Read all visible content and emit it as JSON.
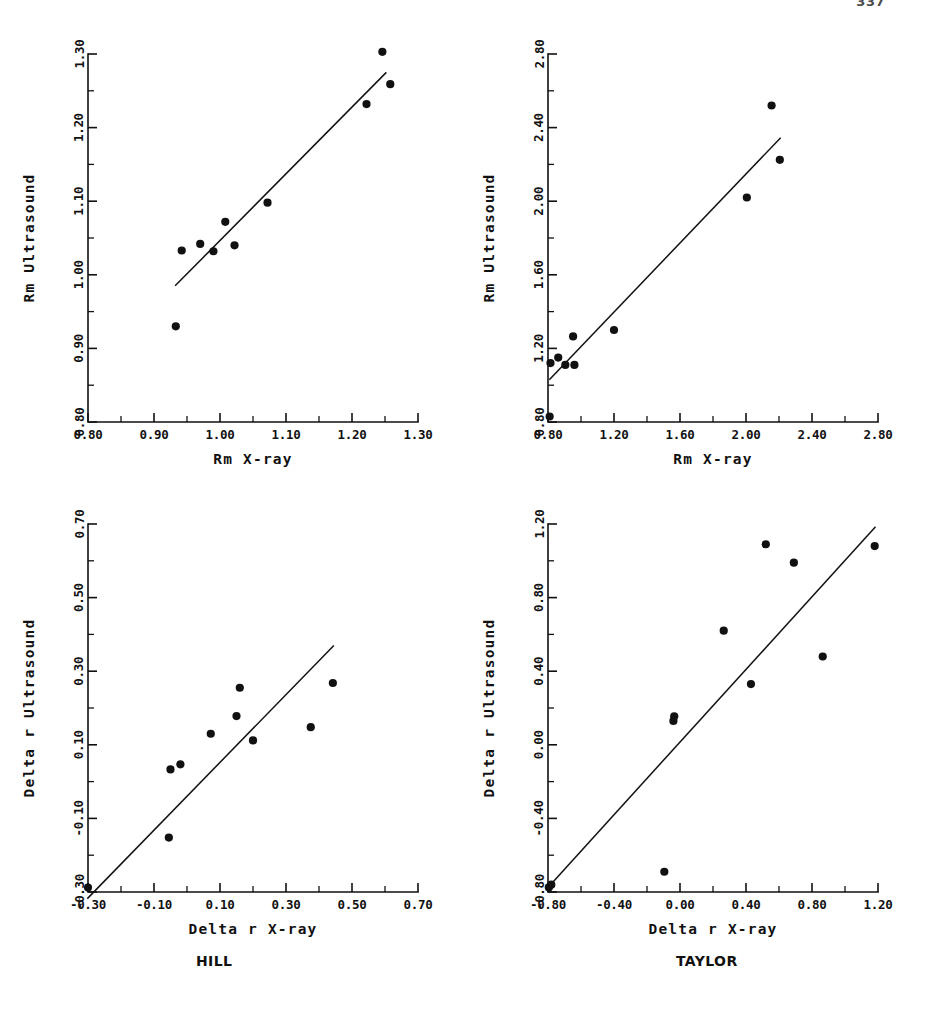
{
  "page": {
    "page_number": "337",
    "captions": [
      {
        "id": "hill",
        "text": "HILL"
      },
      {
        "id": "taylor",
        "text": "TAYLOR"
      }
    ]
  },
  "chart_data": [
    {
      "id": "rm-hill",
      "type": "scatter",
      "title": "",
      "xlabel": "Rm X-ray",
      "ylabel": "Rm Ultrasound",
      "xlim": [
        0.8,
        1.3
      ],
      "ylim": [
        0.8,
        1.3
      ],
      "xticks": [
        0.8,
        0.9,
        1.0,
        1.1,
        1.2,
        1.3
      ],
      "yticks": [
        0.8,
        0.9,
        1.0,
        1.1,
        1.2,
        1.3
      ],
      "xticklabels": [
        "0.80",
        "0.90",
        "1.00",
        "1.10",
        "1.20",
        "1.30"
      ],
      "yticklabels": [
        "0.80",
        "0.90",
        "1.00",
        "1.10",
        "1.20",
        "1.30"
      ],
      "minor_ticks_between": 1,
      "grid": false,
      "legend": "none",
      "points": [
        {
          "x": 0.933,
          "y": 0.93
        },
        {
          "x": 0.942,
          "y": 1.033
        },
        {
          "x": 0.97,
          "y": 1.042
        },
        {
          "x": 0.99,
          "y": 1.032
        },
        {
          "x": 1.008,
          "y": 1.072
        },
        {
          "x": 1.022,
          "y": 1.04
        },
        {
          "x": 1.072,
          "y": 1.098
        },
        {
          "x": 1.222,
          "y": 1.232
        },
        {
          "x": 1.246,
          "y": 1.303
        },
        {
          "x": 1.258,
          "y": 1.259
        }
      ],
      "fit_line": {
        "x0": 0.932,
        "y0": 0.985,
        "x1": 1.252,
        "y1": 1.275
      }
    },
    {
      "id": "rm-taylor",
      "type": "scatter",
      "title": "",
      "xlabel": "Rm X-ray",
      "ylabel": "Rm Ultrasound",
      "xlim": [
        0.8,
        2.8
      ],
      "ylim": [
        0.8,
        2.8
      ],
      "xticks": [
        0.8,
        1.2,
        1.6,
        2.0,
        2.4,
        2.8
      ],
      "yticks": [
        0.8,
        1.2,
        1.6,
        2.0,
        2.4,
        2.8
      ],
      "xticklabels": [
        "0.80",
        "1.20",
        "1.60",
        "2.00",
        "2.40",
        "2.80"
      ],
      "yticklabels": [
        "0.80",
        "1.20",
        "1.60",
        "2.00",
        "2.40",
        "2.80"
      ],
      "minor_ticks_between": 1,
      "grid": false,
      "legend": "none",
      "points": [
        {
          "x": 0.81,
          "y": 0.83
        },
        {
          "x": 0.815,
          "y": 1.12
        },
        {
          "x": 0.862,
          "y": 1.15
        },
        {
          "x": 0.905,
          "y": 1.11
        },
        {
          "x": 0.952,
          "y": 1.265
        },
        {
          "x": 0.96,
          "y": 1.11
        },
        {
          "x": 1.2,
          "y": 1.3
        },
        {
          "x": 2.005,
          "y": 2.02
        },
        {
          "x": 2.155,
          "y": 2.52
        },
        {
          "x": 2.205,
          "y": 2.225
        }
      ],
      "fit_line": {
        "x0": 0.808,
        "y0": 1.03,
        "x1": 2.21,
        "y1": 2.345
      }
    },
    {
      "id": "delta-hill",
      "type": "scatter",
      "title": "",
      "xlabel": "Delta r X-ray",
      "ylabel": "Delta r Ultrasound",
      "xlim": [
        -0.3,
        0.7
      ],
      "ylim": [
        -0.3,
        0.7
      ],
      "xticks": [
        -0.3,
        -0.1,
        0.1,
        0.3,
        0.5,
        0.7
      ],
      "yticks": [
        -0.3,
        -0.1,
        0.1,
        0.3,
        0.5,
        0.7
      ],
      "xticklabels": [
        "-0.30",
        "-0.10",
        "0.10",
        "0.30",
        "0.50",
        "0.70"
      ],
      "yticklabels": [
        "-0.30",
        "-0.10",
        "0.10",
        "0.30",
        "0.50",
        "0.70"
      ],
      "minor_ticks_between": 1,
      "grid": false,
      "legend": "none",
      "points": [
        {
          "x": -0.3,
          "y": -0.288
        },
        {
          "x": -0.055,
          "y": -0.152
        },
        {
          "x": -0.05,
          "y": 0.033
        },
        {
          "x": -0.02,
          "y": 0.047
        },
        {
          "x": 0.072,
          "y": 0.13
        },
        {
          "x": 0.15,
          "y": 0.178
        },
        {
          "x": 0.16,
          "y": 0.255
        },
        {
          "x": 0.2,
          "y": 0.112
        },
        {
          "x": 0.375,
          "y": 0.148
        },
        {
          "x": 0.442,
          "y": 0.268
        }
      ],
      "fit_line": {
        "x0": -0.302,
        "y0": -0.318,
        "x1": 0.445,
        "y1": 0.37
      }
    },
    {
      "id": "delta-taylor",
      "type": "scatter",
      "title": "",
      "xlabel": "Delta r X-ray",
      "ylabel": "Delta r Ultrasound",
      "xlim": [
        -0.8,
        1.2
      ],
      "ylim": [
        -0.8,
        1.2
      ],
      "xticks": [
        -0.8,
        -0.4,
        0.0,
        0.4,
        0.8,
        1.2
      ],
      "yticks": [
        -0.8,
        -0.4,
        0.0,
        0.4,
        0.8,
        1.2
      ],
      "xticklabels": [
        "-0.80",
        "-0.40",
        "0.00",
        "0.40",
        "0.80",
        "1.20"
      ],
      "yticklabels": [
        "-0.80",
        "-0.40",
        "0.00",
        "0.40",
        "0.80",
        "1.20"
      ],
      "minor_ticks_between": 1,
      "grid": false,
      "legend": "none",
      "points": [
        {
          "x": -0.795,
          "y": -0.775
        },
        {
          "x": -0.78,
          "y": -0.76
        },
        {
          "x": -0.095,
          "y": -0.69
        },
        {
          "x": -0.04,
          "y": 0.13
        },
        {
          "x": -0.035,
          "y": 0.155
        },
        {
          "x": 0.265,
          "y": 0.62
        },
        {
          "x": 0.43,
          "y": 0.33
        },
        {
          "x": 0.52,
          "y": 1.09
        },
        {
          "x": 0.69,
          "y": 0.99
        },
        {
          "x": 0.865,
          "y": 0.48
        },
        {
          "x": 1.18,
          "y": 1.08
        }
      ],
      "fit_line": {
        "x0": -0.8,
        "y0": -0.775,
        "x1": 1.185,
        "y1": 1.185
      }
    }
  ]
}
